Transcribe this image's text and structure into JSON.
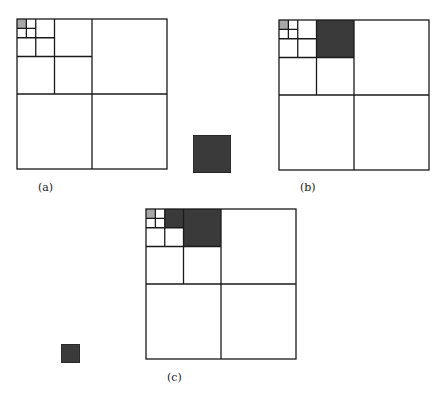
{
  "figure": {
    "panels": [
      {
        "id": "a",
        "label": "(a)",
        "x": 16,
        "y": 18,
        "size": 150,
        "highlight_gray": [
          [
            0,
            0,
            4
          ]
        ],
        "highlight_dark": []
      },
      {
        "id": "b",
        "label": "(b)",
        "x": 278,
        "y": 19,
        "size": 150,
        "highlight_gray": [
          [
            0,
            0,
            4
          ]
        ],
        "highlight_dark": [
          [
            1,
            0,
            2
          ]
        ]
      },
      {
        "id": "c",
        "label": "(c)",
        "x": 145,
        "y": 208,
        "size": 150,
        "highlight_gray": [
          [
            0,
            0,
            4
          ]
        ],
        "highlight_dark": [
          [
            1,
            0,
            3
          ],
          [
            1,
            0,
            2
          ]
        ]
      }
    ],
    "standalone_squares": [
      {
        "id": "large-dark-square",
        "x": 193,
        "y": 135,
        "size": 38
      },
      {
        "id": "small-dark-square",
        "x": 61,
        "y": 344,
        "size": 19
      }
    ],
    "colors": {
      "line": "#1a1a1a",
      "gray_fill": "#a8a8a8",
      "dark_fill": "#3a3a3a",
      "background": "#ffffff"
    },
    "levels": 4
  }
}
